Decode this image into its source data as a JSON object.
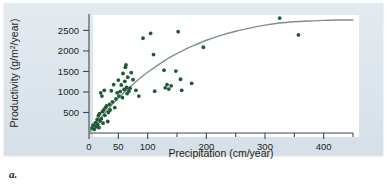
{
  "figure": {
    "caption": "a.",
    "background_color": "#dfe7ed",
    "plot_background_color": "#ffffff"
  },
  "chart_data": {
    "type": "scatter",
    "title": "",
    "subtitle": "",
    "xlabel": "Precipitation (cm/year)",
    "ylabel": "Productivity (g/m²/year)",
    "ylabel_parts": {
      "prefix": "Productivity (g/m",
      "superscript": "2",
      "suffix": "/year)"
    },
    "xlim": [
      0,
      450
    ],
    "ylim": [
      0,
      2900
    ],
    "xticks": [
      0,
      50,
      100,
      150,
      200,
      250,
      300,
      350,
      400,
      450
    ],
    "xtick_labels": [
      "0",
      "50",
      "100",
      "",
      "200",
      "",
      "300",
      "",
      "400",
      ""
    ],
    "yticks": [
      500,
      1000,
      1500,
      2000,
      2500
    ],
    "ytick_labels": [
      "500",
      "1000",
      "1500",
      "2000",
      "2500"
    ],
    "grid": false,
    "legend": false,
    "legend_position": "none",
    "point_color": "#1f5937",
    "point_radius": 1.9,
    "curve_color": "#7d9480",
    "curve_width": 1.4,
    "series": [
      {
        "name": "Sites",
        "marker": "filled-circle",
        "points": [
          [
            5,
            120
          ],
          [
            7,
            190
          ],
          [
            9,
            90
          ],
          [
            11,
            250
          ],
          [
            12,
            150
          ],
          [
            14,
            330
          ],
          [
            15,
            210
          ],
          [
            16,
            420
          ],
          [
            17,
            130
          ],
          [
            18,
            470
          ],
          [
            19,
            290
          ],
          [
            20,
            980
          ],
          [
            21,
            350
          ],
          [
            22,
            900
          ],
          [
            23,
            520
          ],
          [
            24,
            240
          ],
          [
            25,
            560
          ],
          [
            26,
            1040
          ],
          [
            27,
            430
          ],
          [
            28,
            620
          ],
          [
            30,
            660
          ],
          [
            32,
            280
          ],
          [
            33,
            500
          ],
          [
            35,
            700
          ],
          [
            36,
            560
          ],
          [
            38,
            1030
          ],
          [
            40,
            760
          ],
          [
            42,
            1180
          ],
          [
            44,
            620
          ],
          [
            46,
            830
          ],
          [
            48,
            980
          ],
          [
            50,
            1290
          ],
          [
            51,
            900
          ],
          [
            53,
            1010
          ],
          [
            55,
            1170
          ],
          [
            57,
            860
          ],
          [
            58,
            1450
          ],
          [
            60,
            1060
          ],
          [
            61,
            1260
          ],
          [
            62,
            1600
          ],
          [
            63,
            1660
          ],
          [
            64,
            1110
          ],
          [
            65,
            960
          ],
          [
            66,
            1360
          ],
          [
            68,
            1020
          ],
          [
            70,
            1090
          ],
          [
            72,
            1470
          ],
          [
            75,
            1300
          ],
          [
            80,
            1040
          ],
          [
            85,
            900
          ],
          [
            92,
            2310
          ],
          [
            105,
            2430
          ],
          [
            110,
            1910
          ],
          [
            112,
            1020
          ],
          [
            128,
            1530
          ],
          [
            130,
            1100
          ],
          [
            133,
            1180
          ],
          [
            136,
            1070
          ],
          [
            140,
            1150
          ],
          [
            148,
            1510
          ],
          [
            152,
            2470
          ],
          [
            156,
            1310
          ],
          [
            158,
            1040
          ],
          [
            175,
            1210
          ],
          [
            195,
            2090
          ],
          [
            325,
            2800
          ],
          [
            357,
            2390
          ]
        ]
      }
    ],
    "fit_curve": {
      "name": "saturating fit",
      "description": "rising saturating curve approaching ~2750 g/m2/year",
      "points": [
        [
          0,
          0
        ],
        [
          10,
          190
        ],
        [
          20,
          370
        ],
        [
          30,
          540
        ],
        [
          40,
          700
        ],
        [
          50,
          850
        ],
        [
          60,
          990
        ],
        [
          70,
          1120
        ],
        [
          80,
          1250
        ],
        [
          90,
          1370
        ],
        [
          100,
          1480
        ],
        [
          120,
          1680
        ],
        [
          140,
          1860
        ],
        [
          160,
          2010
        ],
        [
          180,
          2140
        ],
        [
          200,
          2260
        ],
        [
          225,
          2380
        ],
        [
          250,
          2480
        ],
        [
          275,
          2560
        ],
        [
          300,
          2630
        ],
        [
          325,
          2680
        ],
        [
          350,
          2710
        ],
        [
          375,
          2730
        ],
        [
          400,
          2745
        ],
        [
          425,
          2752
        ],
        [
          450,
          2755
        ]
      ]
    }
  }
}
